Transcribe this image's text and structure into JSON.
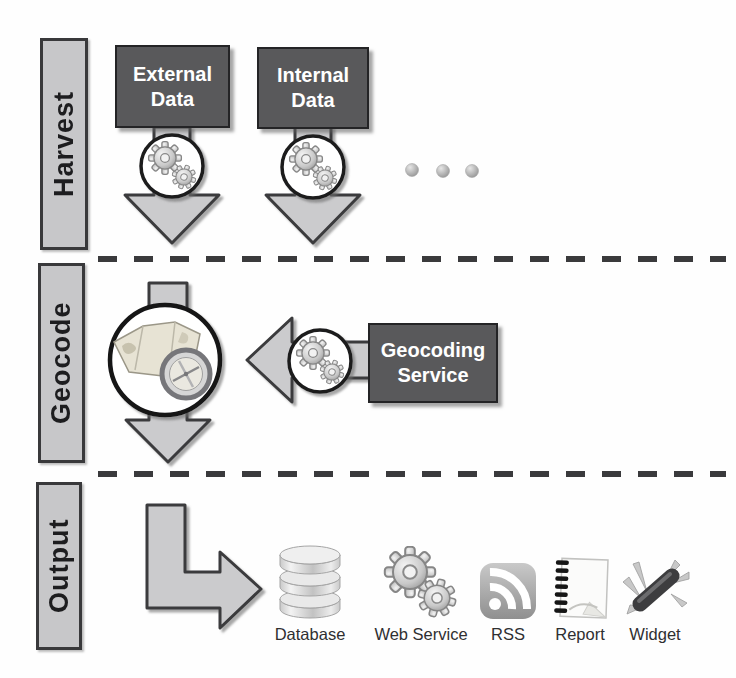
{
  "stages": {
    "harvest": "Harvest",
    "geocode": "Geocode",
    "output": "Output"
  },
  "harvest": {
    "sources": [
      {
        "label": "External Data"
      },
      {
        "label": "Internal Data"
      }
    ],
    "more_sources_hint": "ellipsis-dots"
  },
  "geocode": {
    "service": "Geocoding Service"
  },
  "output": {
    "items": [
      {
        "label": "Database",
        "icon": "database-icon"
      },
      {
        "label": "Web Service",
        "icon": "gears-icon"
      },
      {
        "label": "RSS",
        "icon": "rss-icon"
      },
      {
        "label": "Report",
        "icon": "report-icon"
      },
      {
        "label": "Widget",
        "icon": "widget-icon"
      }
    ]
  },
  "icons": {
    "process": "gears-icon",
    "geocode": "map-compass-icon"
  },
  "colors": {
    "bg": "#fefefe",
    "box_dark": "#59595b",
    "box_dark_border": "#242426",
    "box_light": "#c7c7c9",
    "box_light_border": "#39393b",
    "arrow_fill": "#cbcbcd",
    "arrow_stroke": "#3a3a3c",
    "dash_color": "#3a3a3c",
    "text_dark": "#1d1d1f"
  }
}
